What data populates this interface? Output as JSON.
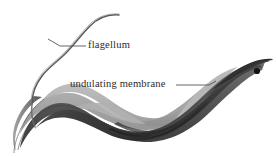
{
  "figure": {
    "background_color": "#ffffff",
    "width": 276,
    "height": 156
  },
  "labels": [
    {
      "id": "flagellum",
      "text": "flagellum",
      "color": "#2b2b2b",
      "leader_line": {
        "x1": 60,
        "y1": 46,
        "x2": 86,
        "y2": 46
      }
    },
    {
      "id": "undulating_membrane",
      "text": "undulating membrane",
      "color": "#2b2b2b",
      "leader_line": {
        "x1": 176,
        "y1": 85,
        "x2": 212,
        "y2": 86
      }
    }
  ],
  "anatomy": {
    "flagellum_label": "flagellum",
    "undulating_membrane_label": "undulating membrane",
    "nucleus_dot_label": "nucleus",
    "body_label": "cell body"
  },
  "colors": {
    "membrane_light": "#b4b4b4",
    "membrane_mid": "#9a9a9a",
    "body_dark": "#3a3a3a",
    "body_mid": "#6e6e6e",
    "body_shadow": "#2e2e2e",
    "outline": "#4a4a4a",
    "flagellum_line": "#5a5a5a",
    "leader_line": "#555555",
    "nucleus": "#1a1a1a",
    "text": "#2b2b2b",
    "background": "#ffffff"
  }
}
